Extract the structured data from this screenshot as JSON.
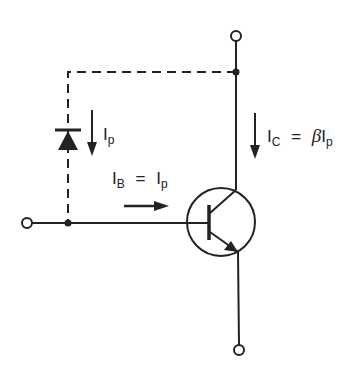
{
  "diagram": {
    "colors": {
      "stroke": "#222222",
      "background": "#ffffff"
    },
    "labels": {
      "diode_current": {
        "main": "I",
        "sub": "p"
      },
      "base_current": {
        "main": "I",
        "sub": "B",
        "eq": "=",
        "rhs_main": "I",
        "rhs_sub": "p"
      },
      "collector_current": {
        "main": "I",
        "sub": "C",
        "eq": "=",
        "beta": "β",
        "rhs_main": "I",
        "rhs_sub": "p"
      }
    },
    "components": [
      {
        "type": "photodiode",
        "connection": "collector to base (dashed)"
      },
      {
        "type": "npn-transistor",
        "terminals": [
          "collector",
          "base",
          "emitter"
        ]
      },
      {
        "type": "terminal",
        "position": "top (collector)"
      },
      {
        "type": "terminal",
        "position": "left (base)"
      },
      {
        "type": "terminal",
        "position": "bottom (emitter)"
      }
    ]
  }
}
